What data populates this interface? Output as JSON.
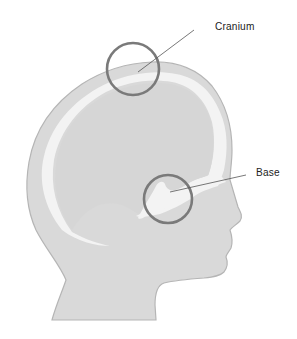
{
  "diagram": {
    "labels": {
      "cranium": "Cranium",
      "base": "Base"
    },
    "colors": {
      "head_fill": "#d9d9d9",
      "head_outline": "#b5b5b5",
      "skull_highlight": "#f2f2f2",
      "circle_stroke": "#7a7a7a",
      "leader_line": "#555555",
      "text": "#222222"
    }
  }
}
